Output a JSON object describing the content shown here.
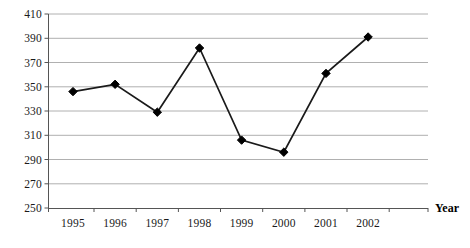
{
  "chart_data": {
    "type": "line",
    "title": "",
    "subtitle": "",
    "xlabel": "Year",
    "ylabel": "",
    "categories": [
      "1995",
      "1996",
      "1997",
      "1998",
      "1999",
      "2000",
      "2001",
      "2002"
    ],
    "values": [
      346,
      352,
      329,
      382,
      306,
      296,
      361,
      391
    ],
    "series": [
      {
        "name": "",
        "values": [
          346,
          352,
          329,
          382,
          306,
          296,
          361,
          391
        ]
      }
    ],
    "ylim": [
      250,
      410
    ],
    "yticks": [
      250,
      270,
      290,
      310,
      330,
      350,
      370,
      390,
      410
    ],
    "ytick_labels": [
      "250",
      "270",
      "290",
      "310",
      "330",
      "350",
      "370",
      "390",
      "410"
    ],
    "xtick_labels": [
      "1995",
      "1996",
      "1997",
      "1998",
      "1999",
      "2000",
      "2001",
      "2002"
    ],
    "grid": true,
    "grid_axis": "y",
    "legend": false,
    "legend_position": "none",
    "marker": "diamond",
    "line_color": "#1a1a1a",
    "marker_color": "#000000",
    "grid_color": "#b0b0b0",
    "axis_color": "#555555",
    "background_color": "#ffffff",
    "annotations": []
  },
  "axis_title": {
    "x_label": "Year"
  }
}
